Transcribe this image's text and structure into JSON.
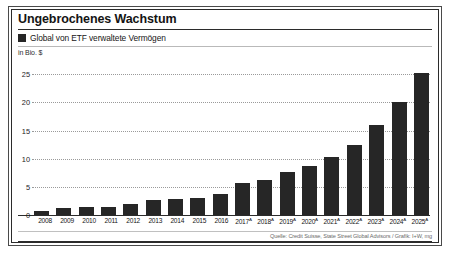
{
  "figure": {
    "title": "Ungebrochenes Wachstum",
    "legend_label": "Global von ETF verwaltete Vermögen",
    "unit_label": "in Bio. $",
    "source": "Quelle: Credit Suisse, State Street Global Advisors / Grafik: I+W, mg",
    "bar_color": "#262626",
    "border_color": "#2b2b2b",
    "grid_color": "#9a9a9a"
  },
  "chart_data": {
    "type": "bar",
    "title": "Ungebrochenes Wachstum",
    "subtitle": "Global von ETF verwaltete Vermögen",
    "xlabel": "",
    "ylabel": "in Bio. $",
    "ylim": [
      0,
      27
    ],
    "yticks": [
      0,
      5,
      10,
      15,
      20,
      25
    ],
    "ytick_labels": [
      "0",
      "5",
      "10",
      "15",
      "20",
      "25"
    ],
    "grid": true,
    "legend": [
      {
        "name": "Global von ETF verwaltete Vermögen",
        "color": "#262626"
      }
    ],
    "categories": [
      "2008",
      "2009",
      "2010",
      "2011",
      "2012",
      "2013",
      "2014",
      "2015",
      "2016",
      "2017",
      "2018",
      "2019",
      "2020",
      "2021",
      "2022",
      "2023",
      "2024",
      "2025"
    ],
    "category_labels": [
      "2008",
      "2009",
      "2010",
      "2011",
      "2012",
      "2013",
      "2014",
      "2015",
      "2016",
      "2017",
      "2018",
      "2019",
      "2020",
      "2021",
      "2022",
      "2023",
      "2024",
      "2025"
    ],
    "forecast_marker": "A",
    "forecast_from": "2017",
    "values": [
      0.8,
      1.3,
      1.5,
      1.5,
      1.9,
      2.6,
      2.9,
      3.0,
      3.7,
      5.7,
      6.3,
      7.6,
      8.7,
      10.3,
      12.5,
      16.0,
      20.0,
      25.2
    ]
  }
}
